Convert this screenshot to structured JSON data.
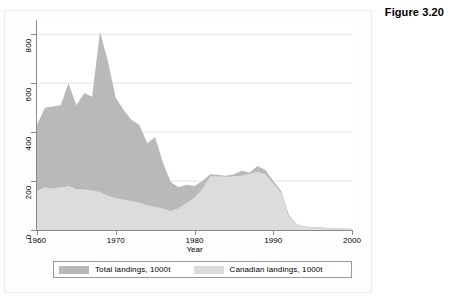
{
  "figure": {
    "title": "Figure 3.20"
  },
  "chart_data": {
    "type": "area",
    "title": "Figure 3.20",
    "xlabel": "Year",
    "ylabel": "",
    "xlim": [
      1960,
      2000
    ],
    "ylim": [
      0,
      850
    ],
    "grid": true,
    "legend_position": "bottom",
    "xticks": [
      1960,
      1970,
      1980,
      1990,
      2000
    ],
    "yticks": [
      0,
      200,
      400,
      600,
      800
    ],
    "xtick_labels": [
      "1960",
      "1970",
      "1980",
      "1990",
      "2000"
    ],
    "ytick_labels": [
      "0",
      "200",
      "400",
      "600",
      "800"
    ],
    "x": [
      1960,
      1961,
      1962,
      1963,
      1964,
      1965,
      1966,
      1967,
      1968,
      1969,
      1970,
      1971,
      1972,
      1973,
      1974,
      1975,
      1976,
      1977,
      1978,
      1979,
      1980,
      1981,
      1982,
      1983,
      1984,
      1985,
      1986,
      1987,
      1988,
      1989,
      1990,
      1991,
      1992,
      1993,
      1994,
      1995,
      1996,
      1997,
      1998,
      1999,
      2000
    ],
    "series": [
      {
        "name": "Total landings, 1000t",
        "color": "#b9b9b9",
        "values": [
          430,
          500,
          505,
          510,
          600,
          510,
          560,
          545,
          810,
          690,
          540,
          490,
          450,
          430,
          355,
          380,
          275,
          195,
          175,
          185,
          180,
          200,
          228,
          225,
          222,
          228,
          242,
          235,
          262,
          245,
          200,
          160,
          60,
          22,
          14,
          12,
          10,
          8,
          7,
          6,
          5
        ]
      },
      {
        "name": "Canadian landings, 1000t",
        "color": "#dcdcdc",
        "values": [
          160,
          175,
          170,
          175,
          180,
          168,
          165,
          162,
          155,
          140,
          130,
          125,
          118,
          112,
          100,
          95,
          88,
          78,
          90,
          110,
          132,
          168,
          220,
          220,
          218,
          220,
          222,
          230,
          238,
          228,
          190,
          152,
          55,
          20,
          13,
          11,
          9,
          7,
          6,
          5,
          4
        ]
      }
    ],
    "annotations": []
  },
  "axes": {
    "x_title": "Year"
  },
  "legend": {
    "entries": [
      {
        "label": "Total landings, 1000t",
        "color": "#b9b9b9"
      },
      {
        "label": "Canadian landings, 1000t",
        "color": "#dcdcdc"
      }
    ]
  }
}
